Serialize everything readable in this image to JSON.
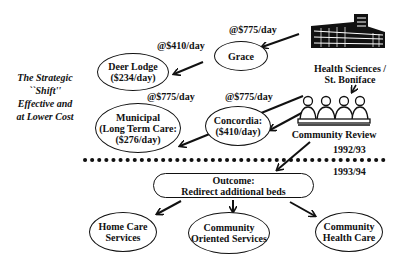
{
  "side_caption": [
    "The Strategic",
    "``Shift''",
    "Effective and",
    "at Lower Cost"
  ],
  "hospital": {
    "icon": "hospital-building-icon",
    "label": [
      "Health Sciences /",
      "St. Boniface"
    ]
  },
  "review": {
    "icon": "meeting-group-icon",
    "label": "Community Review"
  },
  "facilities": {
    "grace": {
      "lines": [
        "Grace"
      ],
      "rate": "@$775/day"
    },
    "deer_lodge": {
      "lines": [
        "Deer Lodge",
        "($234/day)"
      ],
      "rate": "@$410/day"
    },
    "municipal": {
      "lines": [
        "Municipal",
        "(Long Term Care:",
        "($276/day)"
      ],
      "rate": "@$775/day"
    },
    "concordia": {
      "lines": [
        "Concordia:",
        "($410/day)"
      ],
      "rate": "@$775/day"
    }
  },
  "period_before": "1992/93",
  "period_after": "1993/94",
  "outcome": {
    "lines": [
      "Outcome:",
      "Redirect additional beds"
    ]
  },
  "results": [
    {
      "lines": [
        "Home Care",
        "Services"
      ]
    },
    {
      "lines": [
        "Community",
        "Oriented Services"
      ]
    },
    {
      "lines": [
        "Community",
        "Health Care"
      ]
    }
  ]
}
